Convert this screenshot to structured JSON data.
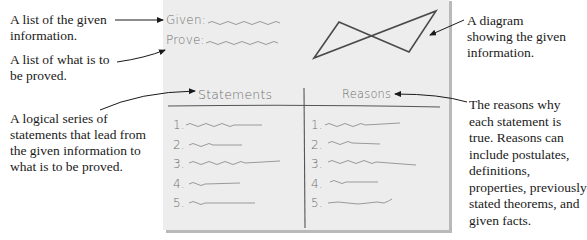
{
  "paper": {
    "given_label": "Given:",
    "prove_label": "Prove:",
    "statements_header": "Statements",
    "reasons_header": "Reasons",
    "statements": [
      "1.",
      "2.",
      "3.",
      "4.",
      "5."
    ],
    "reasons": [
      "1.",
      "2.",
      "3.",
      "4.",
      "5."
    ]
  },
  "annotations": {
    "given": [
      "A list of the given",
      "information."
    ],
    "prove": [
      "A list of what is to",
      "be proved."
    ],
    "statements": [
      "A logical series of",
      "statements that lead from",
      "the given information to",
      "what is to be proved."
    ],
    "diagram": [
      "A diagram",
      "showing the given",
      "information."
    ],
    "reasons": [
      "The reasons why",
      "each statement is",
      "true. Reasons can",
      "include postulates,",
      "definitions,",
      "properties, previously",
      "stated theorems, and",
      "given facts."
    ]
  },
  "colors": {
    "paper": "#ededed",
    "shadow": "#b9b9b9",
    "ink": "#1a1a1a",
    "pencil": "#6f6f6f",
    "squiggle": "#9a9a9a"
  }
}
